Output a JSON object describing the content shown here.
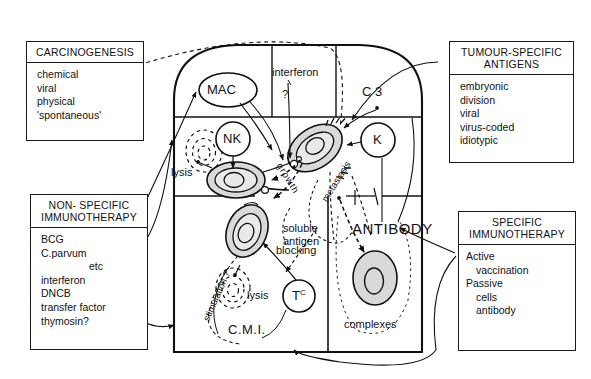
{
  "figure": {
    "background": "#ffffff",
    "ink": "#111111",
    "cell_fill": "#d9d9d9"
  },
  "boxes": [
    {
      "id": "carcinogenesis",
      "header": "CARCINOGENESIS",
      "items": [
        "chemical",
        "viral",
        "physical",
        "'spontaneous'"
      ]
    },
    {
      "id": "tumour_specific_antigens",
      "header_line1": "TUMOUR-SPECIFIC",
      "header_line2": "ANTIGENS",
      "items": [
        "embryonic",
        "division",
        "viral",
        "virus-coded",
        "idiotypic"
      ]
    },
    {
      "id": "non_specific_immunotherapy",
      "header_line1": "NON- SPECIFIC",
      "header_line2": "IMMUNOTHERAPY",
      "items": [
        "BCG",
        "C.parvum",
        "etc",
        "interferon",
        "DNCB",
        "transfer factor",
        "thymosin?"
      ]
    },
    {
      "id": "specific_immunotherapy",
      "header_line1": "SPECIFIC",
      "header_line2": "IMMUNOTHERAPY",
      "items": [
        "Active",
        "vaccination",
        "Passive",
        "cells",
        "antibody"
      ]
    }
  ],
  "effectors": {
    "mac": "MAC",
    "nk": "NK",
    "k": "K",
    "tc_main": "T",
    "tc_sup": "C"
  },
  "labels": {
    "interferon": "interferon",
    "interferon_q": "?",
    "c3": "C 3",
    "lysis_upper": "lysis",
    "lysis_lower": "lysis",
    "growth": "growth",
    "metastasis": "metastasis",
    "soluble_line1": "soluble",
    "soluble_line2": "antigen",
    "blocking": "blocking",
    "antibody": "ANTIBODY",
    "complexes": "complexes",
    "stimulation": "stimulation ?",
    "cmi": "C.M.I."
  },
  "icons": {
    "tumour_cell": "tumour-cell-icon",
    "lysed_cell": "lysed-cell-icon",
    "arrow": "arrow-head-icon"
  }
}
